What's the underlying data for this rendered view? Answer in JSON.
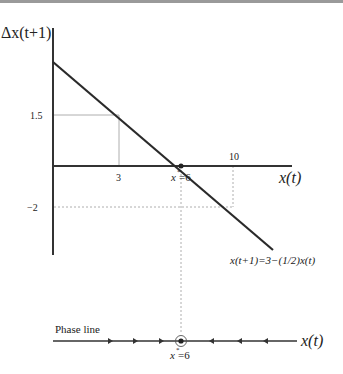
{
  "diagram": {
    "y_axis_label": "Δx(t+1)",
    "x_axis_label": "x(t)",
    "ticks": {
      "y_1_5": "1.5",
      "y_neg2": "−2",
      "x_3": "3",
      "x_10": "10"
    },
    "equilibrium_label": "x*=6",
    "equilibrium_label_base": "x",
    "equilibrium_label_star": "*",
    "equilibrium_label_value": "=6",
    "line_equation": "x(t+1)=3−(1/2)x(t)",
    "phase_line": {
      "title": "Phase line",
      "axis_label": "x(t)",
      "equilibrium_label_base": "x",
      "equilibrium_label_star": "*",
      "equilibrium_label_value": "=6",
      "arrows_left_of_equilibrium": 3,
      "arrows_right_of_equilibrium": 3,
      "arrow_direction_left": "right",
      "arrow_direction_right": "left"
    },
    "colors": {
      "axis": "#333333",
      "line": "#2a2a2a",
      "guide": "#999999",
      "top_bar": "#9a9a9a"
    }
  }
}
